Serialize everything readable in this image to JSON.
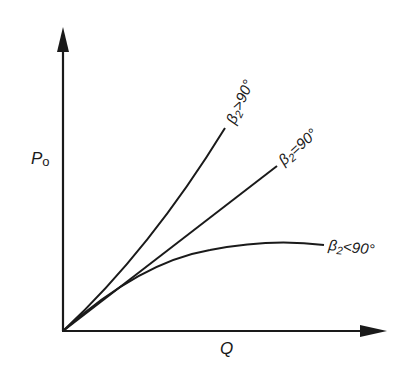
{
  "diagram": {
    "type": "characteristic-curves",
    "axes": {
      "y_label": "P",
      "y_label_sub": "o",
      "x_label": "Q"
    },
    "curves": [
      {
        "name": "beta2-greater-90",
        "label_prefix": "β",
        "label_sub": "2",
        "label_rel": ">90°",
        "shape": "concave-up"
      },
      {
        "name": "beta2-equal-90",
        "label_prefix": "β",
        "label_sub": "2",
        "label_rel": "=90°",
        "shape": "straight"
      },
      {
        "name": "beta2-less-90",
        "label_prefix": "β",
        "label_sub": "2",
        "label_rel": "<90°",
        "shape": "concave-down"
      }
    ],
    "colors": {
      "ink": "#1a1a1a",
      "background": "#ffffff"
    }
  }
}
